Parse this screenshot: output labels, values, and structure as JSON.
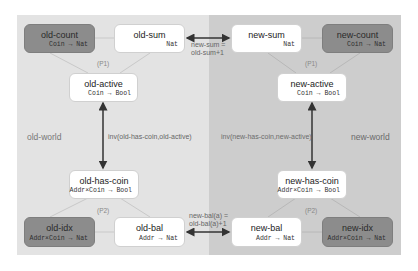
{
  "regions": {
    "old_world": {
      "label": "old-world",
      "color": "#e3e3e3"
    },
    "new_world": {
      "label": "new-world",
      "color": "#cdcdcd"
    }
  },
  "nodes": {
    "old_count": {
      "title": "old-count",
      "type": "Coin → Nat",
      "style": "dark"
    },
    "old_sum": {
      "title": "old-sum",
      "type": "Nat",
      "style": "white"
    },
    "old_active": {
      "title": "old-active",
      "type": "Coin → Bool",
      "style": "white"
    },
    "old_has_coin": {
      "title": "old-has-coin",
      "type": "Addr×Coin → Bool",
      "style": "white"
    },
    "old_idx": {
      "title": "old-idx",
      "type": "Addr×Coin → Nat",
      "style": "dark"
    },
    "old_bal": {
      "title": "old-bal",
      "type": "Addr → Nat",
      "style": "white"
    },
    "new_sum": {
      "title": "new-sum",
      "type": "Nat",
      "style": "white"
    },
    "new_count": {
      "title": "new-count",
      "type": "Coin → Nat",
      "style": "dark"
    },
    "new_active": {
      "title": "new-active",
      "type": "Coin → Bool",
      "style": "white"
    },
    "new_has_coin": {
      "title": "new-has-coin",
      "type": "Addr×Coin → Bool",
      "style": "white"
    },
    "new_bal": {
      "title": "new-bal",
      "type": "Addr → Nat",
      "style": "white"
    },
    "new_idx": {
      "title": "new-idx",
      "type": "Addr×Coin → Nat",
      "style": "dark"
    }
  },
  "groups": {
    "old_p1": "(P1)",
    "old_p2": "(P2)",
    "new_p1": "(P1)",
    "new_p2": "(P2)"
  },
  "edges": {
    "sum_relation": {
      "line1": "new-sum =",
      "line2": "old-sum+1"
    },
    "bal_relation": {
      "line1": "new-bal(a) =",
      "line2": "old-bal(a)+1"
    },
    "old_invariant": "inv(old-has-coin,old-active)",
    "new_invariant": "inv(new-has-coin,new-active)"
  },
  "colors": {
    "dark_node": "#8c8c8c",
    "white_node": "#ffffff",
    "arrow": "#333333",
    "faint_edge": "#c8c8c8"
  }
}
